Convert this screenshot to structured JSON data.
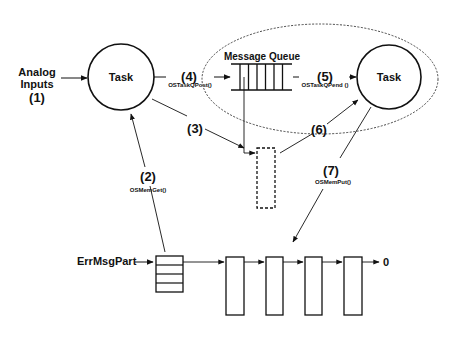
{
  "diagram": {
    "input_label": {
      "line1": "Analog",
      "line2": "Inputs",
      "step": "(1)"
    },
    "task_left": {
      "label": "Task"
    },
    "task_right": {
      "label": "Task"
    },
    "message_queue": {
      "title": "Message Queue",
      "slots": 6
    },
    "steps": {
      "s2": {
        "num": "(2)",
        "call": "OSMemGet()"
      },
      "s3": {
        "num": "(3)"
      },
      "s4": {
        "num": "(4)",
        "call": "OSTaskQPost()"
      },
      "s5": {
        "num": "(5)",
        "call": "OSTaskQPend ()"
      },
      "s6": {
        "num": "(6)"
      },
      "s7": {
        "num": "(7)",
        "call": "OSMemPut()"
      }
    },
    "partition": {
      "label": "ErrMsgPart",
      "free_list_end": "0",
      "free_blocks": 4,
      "control_rows": 4
    }
  }
}
